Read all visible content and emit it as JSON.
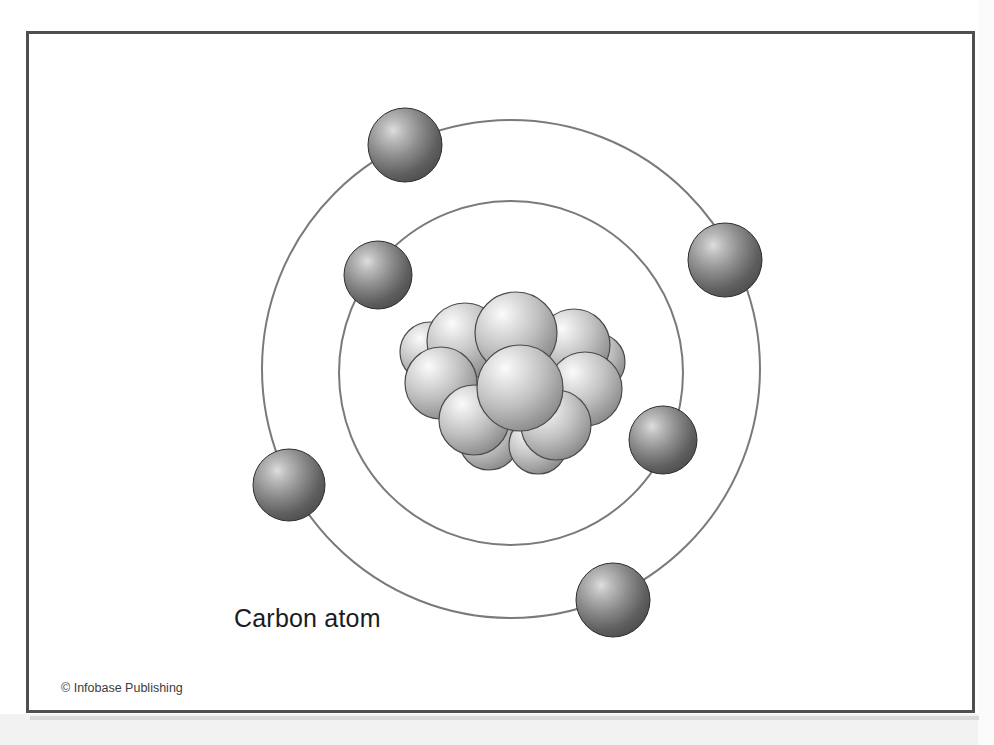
{
  "figure": {
    "title_label": "Carbon atom",
    "credit_label": "© Infobase Publishing",
    "frame_color": "#4f4f4f",
    "background_color": "#ffffff",
    "band_color": "#f2f2f2"
  },
  "diagram_data": {
    "type": "atomic-model",
    "element": "Carbon",
    "atomic_number": 6,
    "orbit_stroke_color": "#7a7a7a",
    "orbit_stroke_width": 2,
    "nucleus": {
      "label": "nucleus",
      "center": [
        511,
        375
      ],
      "particle_count": 12,
      "particle_fill_light": "#f0f0f0",
      "particle_fill_dark": "#8d8d8d",
      "particle_edge": "#4a4a4a",
      "particles": [
        {
          "cx": 516,
          "cy": 333,
          "r": 41
        },
        {
          "cx": 465,
          "cy": 341,
          "r": 38
        },
        {
          "cx": 574,
          "cy": 345,
          "r": 36
        },
        {
          "cx": 441,
          "cy": 383,
          "r": 36
        },
        {
          "cx": 520,
          "cy": 388,
          "r": 43
        },
        {
          "cx": 585,
          "cy": 389,
          "r": 37
        },
        {
          "cx": 474,
          "cy": 420,
          "r": 35
        },
        {
          "cx": 556,
          "cy": 425,
          "r": 35
        },
        {
          "cx": 430,
          "cy": 352,
          "r": 30
        },
        {
          "cx": 596,
          "cy": 362,
          "r": 29
        },
        {
          "cx": 489,
          "cy": 440,
          "r": 30
        },
        {
          "cx": 538,
          "cy": 445,
          "r": 29
        }
      ]
    },
    "orbits": [
      {
        "name": "inner-shell",
        "shell": "K",
        "cx": 511,
        "cy": 373,
        "r": 172,
        "electron_count": 2
      },
      {
        "name": "outer-shell",
        "shell": "L",
        "cx": 511,
        "cy": 369,
        "r": 249,
        "electron_count": 4
      }
    ],
    "electrons": {
      "fill_light": "#c9c9c9",
      "fill_dark": "#4d4d4d",
      "edge": "#2e2e2e",
      "inner": [
        {
          "id": "inner-electron-1",
          "cx": 378,
          "cy": 275,
          "r": 34
        },
        {
          "id": "inner-electron-2",
          "cx": 663,
          "cy": 440,
          "r": 34
        }
      ],
      "outer": [
        {
          "id": "outer-electron-1",
          "cx": 405,
          "cy": 145,
          "r": 37
        },
        {
          "id": "outer-electron-2",
          "cx": 725,
          "cy": 260,
          "r": 37
        },
        {
          "id": "outer-electron-3",
          "cx": 289,
          "cy": 485,
          "r": 36
        },
        {
          "id": "outer-electron-4",
          "cx": 613,
          "cy": 600,
          "r": 37
        }
      ]
    }
  }
}
